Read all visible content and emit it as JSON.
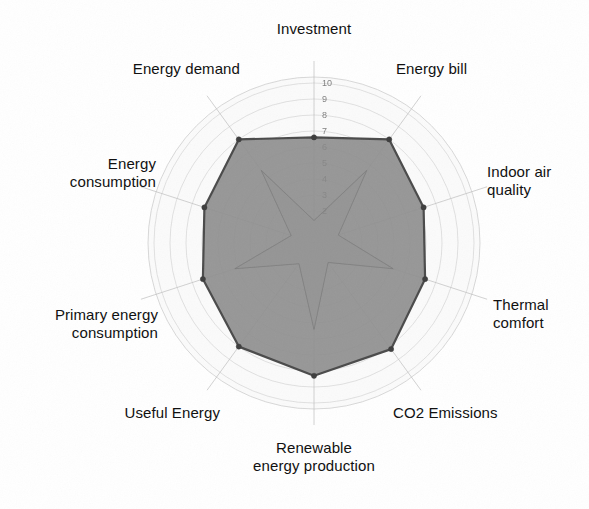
{
  "chart_data": {
    "type": "radar",
    "title": "",
    "subtitle": "",
    "xlabel": "",
    "ylabel": "",
    "grid": true,
    "legend_position": "none",
    "radial_axis": {
      "min": 0,
      "max": 10,
      "tick_labels": [
        "10",
        "9",
        "8",
        "7",
        "6",
        "5",
        "4",
        "3",
        "2"
      ],
      "tick_values": [
        10,
        9,
        8,
        7,
        6,
        5,
        4,
        3,
        2
      ],
      "tick_axis": "Investment"
    },
    "categories": [
      "Investment",
      "Energy bill",
      "Indoor air quality",
      "Thermal comfort",
      "CO2 Emissions",
      "Renewable energy production",
      "Useful Energy",
      "Primary energy consumption",
      "Energy consumption",
      "Energy demand"
    ],
    "series": [
      {
        "name": "outer",
        "values": [
          6.6,
          8.0,
          7.2,
          7.3,
          8.2,
          8.3,
          8.0,
          7.3,
          7.2,
          8.0
        ],
        "fill": "#8e8e8e",
        "stroke": "#4a4a4a"
      },
      {
        "name": "inner",
        "values": [
          1.4,
          5.6,
          1.6,
          5.2,
          1.5,
          5.4,
          1.6,
          5.2,
          1.5,
          5.6
        ],
        "fill": "#a6a6a6",
        "stroke": "#8a8a8a"
      }
    ]
  },
  "axis_labels": [
    {
      "id": "investment",
      "text": "Investment"
    },
    {
      "id": "energy-bill",
      "text": "Energy bill"
    },
    {
      "id": "indoor-air-quality",
      "text": "Indoor air\nquality"
    },
    {
      "id": "thermal-comfort",
      "text": "Thermal\ncomfort"
    },
    {
      "id": "co2-emissions",
      "text": "CO2 Emissions"
    },
    {
      "id": "renewable-energy-production",
      "text": "Renewable\nenergy production"
    },
    {
      "id": "useful-energy",
      "text": "Useful Energy"
    },
    {
      "id": "primary-energy-consumption",
      "text": "Primary energy\nconsumption"
    },
    {
      "id": "energy-consumption",
      "text": "Energy\nconsumption"
    },
    {
      "id": "energy-demand",
      "text": "Energy demand"
    }
  ],
  "ticks": [
    {
      "value": 10,
      "label": "10"
    },
    {
      "value": 9,
      "label": "9"
    },
    {
      "value": 8,
      "label": "8"
    },
    {
      "value": 7,
      "label": "7"
    },
    {
      "value": 6,
      "label": "6"
    },
    {
      "value": 5,
      "label": "5"
    },
    {
      "value": 4,
      "label": "4"
    },
    {
      "value": 3,
      "label": "3"
    },
    {
      "value": 2,
      "label": "2"
    }
  ],
  "colors": {
    "background": "#ffffff",
    "grid_line": "#c9c9c9",
    "spoke_line": "#bdbdbd",
    "outer_fill": "#8e8e8e",
    "outer_stroke": "#4a4a4a",
    "inner_fill": "#a6a6a6",
    "inner_stroke": "#8d8d8d",
    "marker": "#3d3d3d",
    "label_text": "#111111",
    "tick_text": "#7a7a7a"
  },
  "geometry": {
    "center_x": 314,
    "center_y": 243,
    "radius_max": 160
  }
}
